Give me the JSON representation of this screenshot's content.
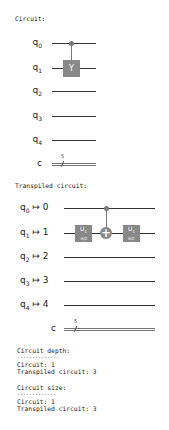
{
  "circuit": {
    "heading": "Circuit:",
    "qubits": [
      {
        "name": "q",
        "index": "0"
      },
      {
        "name": "q",
        "index": "1"
      },
      {
        "name": "q",
        "index": "2"
      },
      {
        "name": "q",
        "index": "3"
      },
      {
        "name": "q",
        "index": "4"
      }
    ],
    "classical": {
      "name": "c",
      "size": "5"
    },
    "gates": [
      {
        "type": "controlled",
        "label": "Y",
        "control": "q0",
        "target": "q1"
      }
    ]
  },
  "transpiled": {
    "heading": "Transpiled circuit:",
    "qubits": [
      {
        "name": "q",
        "index": "0",
        "arrow": "↦",
        "physical": "0"
      },
      {
        "name": "q",
        "index": "1",
        "arrow": "↦",
        "physical": "1"
      },
      {
        "name": "q",
        "index": "2",
        "arrow": "↦",
        "physical": "2"
      },
      {
        "name": "q",
        "index": "3",
        "arrow": "↦",
        "physical": "3"
      },
      {
        "name": "q",
        "index": "4",
        "arrow": "↦",
        "physical": "4"
      }
    ],
    "classical": {
      "name": "c",
      "size": "5"
    },
    "gates": [
      {
        "label": "U",
        "sub": "1",
        "param": "-π/2"
      },
      {
        "type": "cx",
        "control": "q0",
        "target": "q1"
      },
      {
        "label": "U",
        "sub": "1",
        "param": "π/2"
      }
    ]
  },
  "stats": {
    "depth_heading": "Circuit depth:",
    "depth_rule": "--------------",
    "depth_circuit": "Circuit: 1",
    "depth_transpiled": "Transpiled circuit: 3",
    "size_heading": "Circuit size:",
    "size_rule": "-------------",
    "size_circuit": "Circuit: 1",
    "size_transpiled": "Transpiled circuit: 3"
  }
}
